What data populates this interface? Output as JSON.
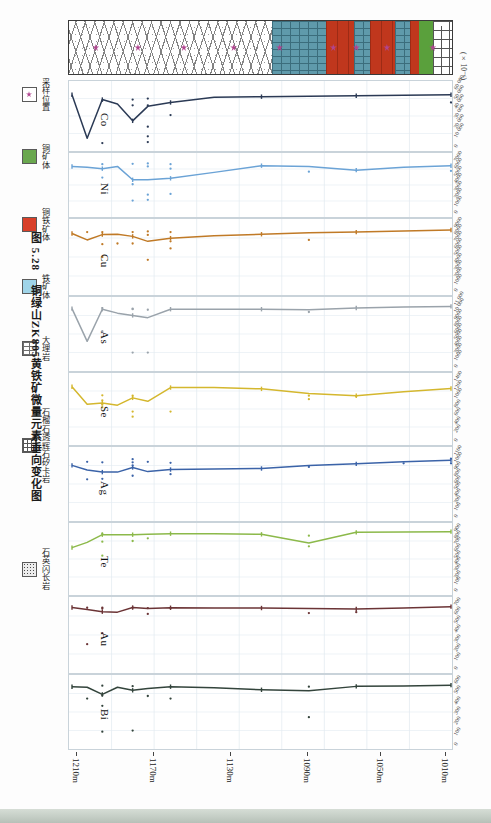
{
  "figure": {
    "caption_number": "图 5.28",
    "caption_text": "铜绿山ZK805黄铁矿微量元素垂向变化图",
    "unit_label": "(×10⁻⁶)"
  },
  "legend": {
    "items": [
      {
        "label": "采样位置",
        "swatch": "sample-star-icon"
      },
      {
        "label": "铜矿体",
        "swatch": "green-orebody-icon"
      },
      {
        "label": "铜铁矿体",
        "swatch": "red-orebody-icon"
      },
      {
        "label": "铁矿体",
        "swatch": "blue-orebody-icon"
      },
      {
        "label": "大理岩",
        "swatch": "marble-pattern-icon"
      },
      {
        "label": "石榴石透辉石矽卡岩",
        "swatch": "skarn-pattern-icon"
      },
      {
        "label": "石英闪长岩",
        "swatch": "quartz-diorite-pattern-icon"
      }
    ]
  },
  "lithology": {
    "segments": [
      {
        "name": "大理岩",
        "pattern": "marble",
        "width_pct": 53.0
      },
      {
        "name": "矽卡岩",
        "pattern": "skarn",
        "width_pct": 14.0
      },
      {
        "name": "铜铁矿体",
        "pattern": "copper",
        "width_pct": 7.5
      },
      {
        "name": "铁矿体",
        "pattern": "skarn",
        "width_pct": 4.0
      },
      {
        "name": "铜铁矿体",
        "pattern": "copper",
        "width_pct": 6.5
      },
      {
        "name": "铁矿体",
        "pattern": "skarn",
        "width_pct": 4.0
      },
      {
        "name": "铜铁矿体",
        "pattern": "copper",
        "width_pct": 2.5
      },
      {
        "name": "铜矿体",
        "pattern": "green",
        "width_pct": 3.5
      },
      {
        "name": "石英闪长岩",
        "pattern": "brick",
        "width_pct": 5.0
      }
    ],
    "sample_marks_pct": [
      7,
      18,
      30,
      43,
      55,
      69,
      75,
      83,
      95
    ]
  },
  "depth_axis": {
    "label_unit": "m",
    "ticks": [
      "1210m",
      "1170m",
      "1130m",
      "1090m",
      "1050m",
      "1010m"
    ],
    "tick_pct": [
      2,
      22,
      42,
      62,
      81,
      98
    ]
  },
  "chart_data": {
    "type": "line",
    "title": "铜绿山ZK805黄铁矿微量元素垂向变化图",
    "xlabel": "深度 (m)",
    "ylabel": "含量 (×10⁻⁶)",
    "grid": true,
    "legend_position": "left",
    "x": [
      1210,
      1185,
      1160,
      1135,
      1110,
      1085,
      1062,
      1050,
      1042,
      1034,
      1026,
      1018,
      1010
    ],
    "panels": [
      {
        "element": "Co",
        "color": "#2b3a55",
        "ylim": [
          0,
          60000
        ],
        "yticks": [
          "0",
          "10 000",
          "20 000",
          "30 000",
          "40 000",
          "50 000",
          "60 000"
        ],
        "values": [
          52000,
          51500,
          51000,
          50500,
          50000,
          49500,
          44000,
          40000,
          25000,
          42500,
          47000,
          7000,
          52000
        ],
        "scatter": [
          {
            "x": 1210,
            "y": 44000
          },
          {
            "x": 1062,
            "y": 31000
          },
          {
            "x": 1050,
            "y": 48000
          },
          {
            "x": 1050,
            "y": 41000
          },
          {
            "x": 1042,
            "y": 47000
          },
          {
            "x": 1042,
            "y": 41000
          },
          {
            "x": 1050,
            "y": 19000
          },
          {
            "x": 1050,
            "y": 9000
          },
          {
            "x": 1050,
            "y": 3000
          },
          {
            "x": 1026,
            "y": 46000
          },
          {
            "x": 1026,
            "y": 2000
          }
        ]
      },
      {
        "element": "Ni",
        "color": "#6ba3d6",
        "ylim": [
          0,
          7000
        ],
        "yticks": [
          "0",
          "1000",
          "2000",
          "3000",
          "4000",
          "5000",
          "6000",
          "7000"
        ],
        "values": [
          6100,
          5900,
          5500,
          6000,
          6100,
          5200,
          4400,
          4200,
          4200,
          6000,
          5700,
          5900,
          6000
        ],
        "scatter": [
          {
            "x": 1210,
            "y": 5400
          },
          {
            "x": 1135,
            "y": 5300
          },
          {
            "x": 1062,
            "y": 6300
          },
          {
            "x": 1062,
            "y": 5700
          },
          {
            "x": 1050,
            "y": 6400
          },
          {
            "x": 1050,
            "y": 6000
          },
          {
            "x": 1042,
            "y": 6350
          },
          {
            "x": 1042,
            "y": 3600
          },
          {
            "x": 1026,
            "y": 6300
          },
          {
            "x": 1026,
            "y": 4500
          },
          {
            "x": 1062,
            "y": 2300
          },
          {
            "x": 1050,
            "y": 2200
          },
          {
            "x": 1050,
            "y": 1500
          },
          {
            "x": 1042,
            "y": 1400
          }
        ]
      },
      {
        "element": "Cu",
        "color": "#c07a27",
        "ylim": [
          0,
          9000
        ],
        "yticks": [
          "0",
          "1000",
          "2000",
          "3000",
          "4000",
          "5000",
          "6000",
          "7000",
          "8000",
          "9000"
        ],
        "values": [
          8300,
          8150,
          8000,
          7900,
          7700,
          7500,
          7150,
          6700,
          7400,
          7700,
          7650,
          6900,
          7800
        ],
        "scatter": [
          {
            "x": 1135,
            "y": 6900
          },
          {
            "x": 1062,
            "y": 8000
          },
          {
            "x": 1062,
            "y": 6700
          },
          {
            "x": 1062,
            "y": 5700
          },
          {
            "x": 1050,
            "y": 8100
          },
          {
            "x": 1050,
            "y": 7600
          },
          {
            "x": 1042,
            "y": 8000
          },
          {
            "x": 1042,
            "y": 6400
          },
          {
            "x": 1034,
            "y": 6400
          },
          {
            "x": 1026,
            "y": 8000
          },
          {
            "x": 1018,
            "y": 8000
          },
          {
            "x": 1050,
            "y": 4100
          },
          {
            "x": 1026,
            "y": 6300
          },
          {
            "x": 1026,
            "y": 4500
          }
        ]
      },
      {
        "element": "As",
        "color": "#9aa3ab",
        "ylim": [
          0,
          11000
        ],
        "yticks": [
          "0",
          "1000",
          "2000",
          "4000",
          "5000",
          "6000",
          "8000",
          "9000",
          "10 000",
          "11 000"
        ],
        "values": [
          10400,
          10300,
          10100,
          9800,
          9900,
          9900,
          9900,
          8400,
          8800,
          9200,
          9900,
          4200,
          10000
        ],
        "scatter": [
          {
            "x": 1135,
            "y": 9400
          },
          {
            "x": 1050,
            "y": 9800
          },
          {
            "x": 1042,
            "y": 10000
          },
          {
            "x": 1042,
            "y": 9900
          },
          {
            "x": 1026,
            "y": 10100
          },
          {
            "x": 1026,
            "y": 6000
          },
          {
            "x": 1050,
            "y": 2200
          },
          {
            "x": 1042,
            "y": 2200
          }
        ]
      },
      {
        "element": "Se",
        "color": "#d4b72e",
        "ylim": [
          0,
          1400
        ],
        "yticks": [
          "0",
          "200",
          "400",
          "600",
          "800",
          "1000",
          "1200",
          "1400"
        ],
        "values": [
          1180,
          1100,
          1010,
          1060,
          1170,
          1200,
          1200,
          880,
          960,
          790,
          840,
          810,
          1220
        ],
        "scatter": [
          {
            "x": 1135,
            "y": 1010
          },
          {
            "x": 1135,
            "y": 930
          },
          {
            "x": 1160,
            "y": 1000
          },
          {
            "x": 1062,
            "y": 640
          },
          {
            "x": 1042,
            "y": 1010
          },
          {
            "x": 1042,
            "y": 640
          },
          {
            "x": 1042,
            "y": 520
          },
          {
            "x": 1026,
            "y": 1020
          },
          {
            "x": 1026,
            "y": 900
          },
          {
            "x": 1026,
            "y": 800
          },
          {
            "x": 1026,
            "y": 740
          }
        ]
      },
      {
        "element": "Ag",
        "color": "#3b63a8",
        "ylim": [
          0,
          1200
        ],
        "yticks": [
          "0",
          "100",
          "200",
          "400",
          "500",
          "600",
          "800",
          "900",
          "1000",
          "1100"
        ],
        "values": [
          1060,
          1030,
          990,
          960,
          900,
          890,
          880,
          840,
          920,
          830,
          830,
          870,
          960
        ],
        "scatter": [
          {
            "x": 1210,
            "y": 1090
          },
          {
            "x": 1210,
            "y": 1000
          },
          {
            "x": 1185,
            "y": 1000
          },
          {
            "x": 1135,
            "y": 930
          },
          {
            "x": 1062,
            "y": 1010
          },
          {
            "x": 1050,
            "y": 1030
          },
          {
            "x": 1042,
            "y": 1080
          },
          {
            "x": 1042,
            "y": 1020
          },
          {
            "x": 1042,
            "y": 960
          },
          {
            "x": 1026,
            "y": 1020
          },
          {
            "x": 1018,
            "y": 1030
          },
          {
            "x": 1062,
            "y": 790
          },
          {
            "x": 1042,
            "y": 760
          },
          {
            "x": 1026,
            "y": 700
          },
          {
            "x": 1018,
            "y": 690
          }
        ]
      },
      {
        "element": "Te",
        "color": "#8cb94a",
        "ylim": [
          0,
          900
        ],
        "yticks": [
          "0",
          "100",
          "200",
          "300",
          "400",
          "500",
          "600",
          "700",
          "800",
          "900"
        ],
        "values": [
          860,
          855,
          850,
          690,
          820,
          830,
          830,
          820,
          815,
          815,
          815,
          700,
          620
        ],
        "scatter": [
          {
            "x": 1135,
            "y": 800
          },
          {
            "x": 1135,
            "y": 640
          },
          {
            "x": 1050,
            "y": 760
          },
          {
            "x": 1042,
            "y": 720
          },
          {
            "x": 1026,
            "y": 830
          },
          {
            "x": 1026,
            "y": 710
          },
          {
            "x": 1026,
            "y": 500
          }
        ]
      },
      {
        "element": "Au",
        "color": "#6b3436",
        "ylim": [
          0,
          700
        ],
        "yticks": [
          "0",
          "100",
          "200",
          "300",
          "400",
          "500",
          "600",
          "700"
        ],
        "values": [
          660,
          645,
          635,
          640,
          645,
          645,
          648,
          640,
          650,
          600,
          605,
          630,
          650
        ],
        "scatter": [
          {
            "x": 1160,
            "y": 600
          },
          {
            "x": 1135,
            "y": 590
          },
          {
            "x": 1062,
            "y": 645
          },
          {
            "x": 1050,
            "y": 645
          },
          {
            "x": 1050,
            "y": 580
          },
          {
            "x": 1042,
            "y": 650
          },
          {
            "x": 1026,
            "y": 650
          },
          {
            "x": 1026,
            "y": 640
          },
          {
            "x": 1018,
            "y": 648
          },
          {
            "x": 1026,
            "y": 370
          },
          {
            "x": 1018,
            "y": 250
          }
        ]
      },
      {
        "element": "Bi",
        "color": "#33443c",
        "ylim": [
          0,
          600
        ],
        "yticks": [
          "0",
          "100",
          "200",
          "300",
          "400",
          "500",
          "600"
        ],
        "values": [
          560,
          552,
          548,
          505,
          515,
          535,
          545,
          528,
          510,
          540,
          470,
          540,
          545
        ],
        "scatter": [
          {
            "x": 1135,
            "y": 545
          },
          {
            "x": 1135,
            "y": 250
          },
          {
            "x": 1062,
            "y": 430
          },
          {
            "x": 1050,
            "y": 455
          },
          {
            "x": 1042,
            "y": 550
          },
          {
            "x": 1026,
            "y": 555
          },
          {
            "x": 1026,
            "y": 460
          },
          {
            "x": 1026,
            "y": 360
          },
          {
            "x": 1018,
            "y": 430
          },
          {
            "x": 1042,
            "y": 120
          },
          {
            "x": 1026,
            "y": 110
          }
        ]
      }
    ]
  }
}
